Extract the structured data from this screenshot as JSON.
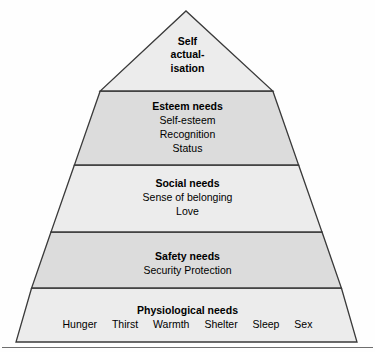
{
  "diagram": {
    "type": "pyramid",
    "name": "maslow-hierarchy-of-needs",
    "geometry": {
      "apex_x": 186,
      "apex_y": 11,
      "base_left_x": 16,
      "base_right_x": 357,
      "base_y": 342,
      "divider_y": [
        91,
        165,
        232,
        288
      ]
    },
    "colors": {
      "outline": "#3a3a3a",
      "fill_light": "#ececec",
      "fill_dark": "#dcdcdc",
      "text": "#000000",
      "background": "#fefefe",
      "baseline_rule": "#6e6e6e"
    },
    "tiers": [
      {
        "id": "self-actualisation",
        "level": 5,
        "shade": "light",
        "title_lines": [
          "Self",
          "actual-",
          "isation"
        ],
        "title": "Self actualisation",
        "items": []
      },
      {
        "id": "esteem",
        "level": 4,
        "shade": "dark",
        "title": "Esteem needs",
        "items": [
          "Self-esteem",
          "Recognition",
          "Status"
        ]
      },
      {
        "id": "social",
        "level": 3,
        "shade": "light",
        "title": "Social needs",
        "items": [
          "Sense of belonging",
          "Love"
        ]
      },
      {
        "id": "safety",
        "level": 2,
        "shade": "dark",
        "title": "Safety needs",
        "items": [
          "Security Protection"
        ]
      },
      {
        "id": "physiological",
        "level": 1,
        "shade": "light",
        "title": "Physiological needs",
        "items": [
          "Hunger",
          "Thirst",
          "Warmth",
          "Shelter",
          "Sleep",
          "Sex"
        ]
      }
    ]
  }
}
